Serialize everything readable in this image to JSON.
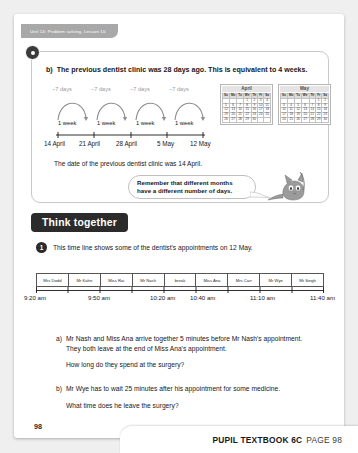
{
  "header": {
    "unit_tab": "Unit 14: Problem solving, Lesson 10"
  },
  "panel": {
    "badge_icon": "bullet-dot-icon",
    "question_label": "b)",
    "question_text": "The previous dentist clinic was 28 days ago. This is equivalent to 4 weeks.",
    "number_line": {
      "jump_labels": [
        "−7 days",
        "−7 days",
        "−7 days",
        "−7 days"
      ],
      "interval_labels": [
        "1 week",
        "1 week",
        "1 week",
        "1 week"
      ],
      "tick_labels": [
        "14 April",
        "21 April",
        "28 April",
        "5 May",
        "12 May"
      ]
    },
    "calendars": [
      {
        "title": "April",
        "weekday_headers": [
          "Su",
          "Mo",
          "Tu",
          "We",
          "Th",
          "Fr",
          "Sa"
        ],
        "weeks": [
          [
            "",
            "",
            "",
            "1",
            "2",
            "3",
            "4"
          ],
          [
            "5",
            "6",
            "7",
            "8",
            "9",
            "10",
            "11"
          ],
          [
            "12",
            "13",
            "14",
            "15",
            "16",
            "17",
            "18"
          ],
          [
            "19",
            "20",
            "21",
            "22",
            "23",
            "24",
            "25"
          ],
          [
            "26",
            "27",
            "28",
            "29",
            "30",
            "",
            ""
          ]
        ]
      },
      {
        "title": "May",
        "weekday_headers": [
          "Su",
          "Mo",
          "Tu",
          "We",
          "Th",
          "Fr",
          "Sa"
        ],
        "weeks": [
          [
            "",
            "",
            "",
            "",
            "",
            "1",
            "2"
          ],
          [
            "3",
            "4",
            "5",
            "6",
            "7",
            "8",
            "9"
          ],
          [
            "10",
            "11",
            "12",
            "13",
            "14",
            "15",
            "16"
          ],
          [
            "17",
            "18",
            "19",
            "20",
            "21",
            "22",
            "23"
          ],
          [
            "24",
            "25",
            "26",
            "27",
            "28",
            "29",
            "30"
          ]
        ]
      }
    ],
    "answer_sentence": "The date of the previous dentist clinic was 14 April.",
    "speech_bubble": {
      "line1": "Remember that different months",
      "line2": "have a different number of days.",
      "character": "cat-character"
    }
  },
  "think_together": {
    "banner_label": "Think together",
    "item_number": "1",
    "intro": "This time line shows some of the dentist's appointments on 12 May.",
    "timeline": {
      "slots": [
        "Mrs Dodd",
        "Mr Kahn",
        "Miss Rai",
        "Mr Nash",
        "break",
        "Miss Ana",
        "Mrs Carr",
        "Mr Wye",
        "Mr Singh"
      ],
      "times": [
        "9:20 am",
        "9:50 am",
        "10:20 am",
        "10:40 am",
        "11:10 am",
        "11:40 am"
      ]
    },
    "questions": [
      {
        "label": "a)",
        "body": "Mr Nash and Miss Ana arrive together 5 minutes before Mr Nash's appointment. They both leave at the end of Miss Ana's appointment.",
        "follow_up": "How long do they spend at the surgery?"
      },
      {
        "label": "b)",
        "body": "Mr Wye has to wait 25 minutes after his appointment for some medicine.",
        "follow_up": "What time does he leave the surgery?"
      }
    ]
  },
  "footer": {
    "page_number": "98",
    "book_label": "PUPIL TEXTBOOK 6C",
    "page_label": "PAGE 98"
  }
}
